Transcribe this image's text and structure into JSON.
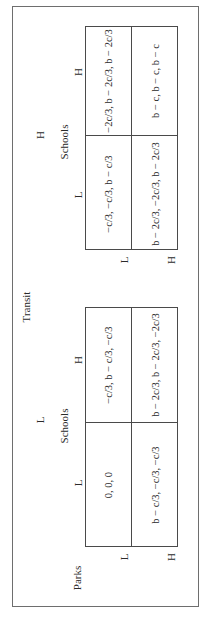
{
  "figure": {
    "player_labels": {
      "transit": "Transit",
      "schools": "Schools",
      "parks": "Parks"
    },
    "strategies": {
      "low": "L",
      "high": "H"
    },
    "tables": [
      {
        "transit": "L",
        "schools_label": "Schools",
        "columns": [
          "L",
          "H"
        ],
        "rows": [
          {
            "parks": "L",
            "cells": [
              "0, 0, 0",
              "−c/3, b − c/3, −c/3"
            ]
          },
          {
            "parks": "H",
            "cells": [
              "b − c/3, −c/3, −c/3",
              "b − 2c/3, b − 2c/3, −2c/3"
            ]
          }
        ]
      },
      {
        "transit": "H",
        "schools_label": "Schools",
        "columns": [
          "L",
          "H"
        ],
        "rows": [
          {
            "parks": "L",
            "cells": [
              "−c/3, −c/3, b − c/3",
              "−2c/3, b − 2c/3, b − 2c/3"
            ]
          },
          {
            "parks": "H",
            "cells": [
              "b − 2c/3, −2c/3, b − 2c/3",
              "b − c, b − c, b − c"
            ]
          }
        ]
      }
    ]
  }
}
